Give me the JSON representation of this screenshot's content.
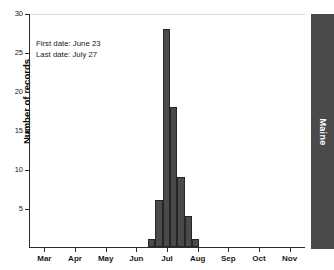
{
  "chart_data": {
    "type": "bar",
    "title": "",
    "subtitle": "",
    "xlabel": "",
    "ylabel": "Number of records",
    "ylim": [
      0,
      30
    ],
    "yticks": [
      5,
      10,
      15,
      20,
      25,
      30
    ],
    "ytick_labels": [
      "5",
      "10",
      "15",
      "20",
      "25",
      "30"
    ],
    "xtick_labels": [
      "Mar",
      "Apr",
      "May",
      "Jun",
      "Jul",
      "Aug",
      "Sep",
      "Oct",
      "Nov"
    ],
    "grid": false,
    "legend_position": "none",
    "bar_color": "#4a4a4a",
    "bar_edge_color": "#262626",
    "categories": [
      "Jun 18",
      "Jun 25",
      "Jul 2",
      "Jul 9",
      "Jul 16",
      "Jul 23",
      "Jul 30"
    ],
    "values": [
      1,
      6,
      28,
      18,
      9,
      4,
      1
    ],
    "annotations": [
      "First date: June 23",
      "Last date: July 27"
    ],
    "region_label": "Maine"
  },
  "axis": {
    "y_title": "Number of records",
    "y_tick_labels": [
      "5",
      "10",
      "15",
      "20",
      "25",
      "30"
    ],
    "x_tick_labels": [
      "Mar",
      "Apr",
      "May",
      "Jun",
      "Jul",
      "Aug",
      "Sep",
      "Oct",
      "Nov"
    ]
  },
  "annotations": {
    "first_date": "First date: June 23",
    "last_date": "Last date: July 27"
  },
  "region": {
    "label": "Maine"
  },
  "colors": {
    "bar_fill": "#4a4a4a",
    "bar_edge": "#262626",
    "axis": "#2b2b2b",
    "band_fill": "#4a4a4a",
    "band_text": "#ffffff"
  }
}
